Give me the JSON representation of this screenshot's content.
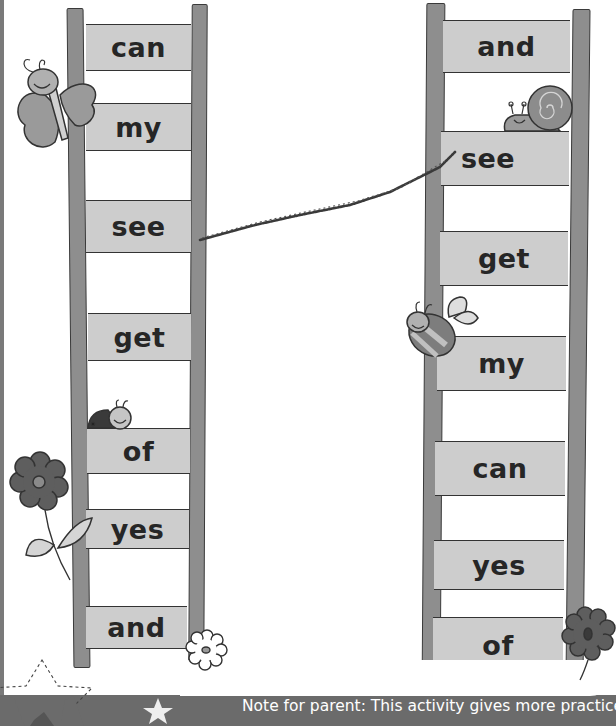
{
  "activity": {
    "left_ladder": {
      "rungs": [
        {
          "word": "can"
        },
        {
          "word": "my"
        },
        {
          "word": "see"
        },
        {
          "word": "get"
        },
        {
          "word": "of"
        },
        {
          "word": "yes"
        },
        {
          "word": "and"
        }
      ]
    },
    "right_ladder": {
      "rungs": [
        {
          "word": "and"
        },
        {
          "word": "see"
        },
        {
          "word": "get"
        },
        {
          "word": "my"
        },
        {
          "word": "can"
        },
        {
          "word": "yes"
        },
        {
          "word": "of"
        }
      ]
    },
    "drawn_connection": {
      "from": "left:see",
      "to": "right:see"
    },
    "decorations": [
      "butterfly",
      "snail",
      "ladybird",
      "bee",
      "dark-flower-left",
      "white-flower",
      "dark-flower-right",
      "dashed-star-outline",
      "small-white-star"
    ]
  },
  "footer": {
    "note": "Note for parent: This activity gives more practice in reading"
  },
  "colors": {
    "rail": "#8e8e8e",
    "rung": "#cdcdcd",
    "text": "#262626",
    "footer_band": "#6b6b6b"
  }
}
